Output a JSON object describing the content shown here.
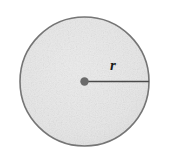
{
  "figure": {
    "type": "geometry-diagram",
    "background_color": "#ffffff",
    "labels": {
      "radius": "r"
    },
    "shapes": {
      "circle": {
        "name": "circle-outline",
        "center_x": 84.5,
        "center_y": 81.5,
        "radius": 64.5,
        "fill_color": "#e6e6e6",
        "stroke_color": "#757575",
        "stroke_width": 1.6
      },
      "center_point": {
        "name": "center-dot",
        "center_x": 84.5,
        "center_y": 81.5,
        "radius": 4.2,
        "fill_color": "#6b6b6b"
      },
      "radius_segment": {
        "name": "radius-line",
        "x1": 84.5,
        "y1": 81.5,
        "x2": 149,
        "y2": 81.5,
        "stroke_color": "#4a4a4a",
        "stroke_width": 1.6
      }
    }
  }
}
